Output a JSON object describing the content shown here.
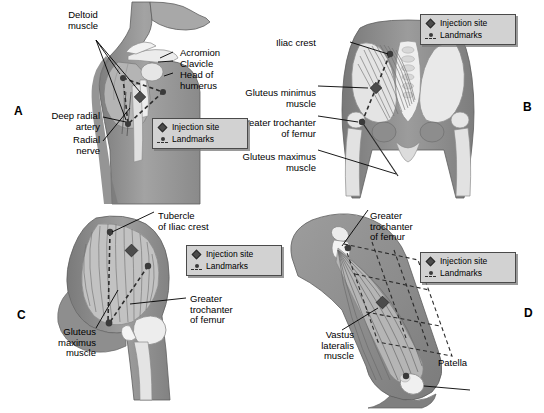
{
  "figure": {
    "background_color": "#ffffff",
    "body_color": "#909090",
    "bone_color": "#e8e8e8",
    "muscle_color": "#bdbdbd",
    "marker_color": "#4c4c4c"
  },
  "legend": {
    "injection_site_label": "Injection site",
    "landmarks_label": "Landmarks",
    "injection_site_icon": "diamond-marker-icon",
    "landmarks_icon": "dot-and-dashed-line-icon",
    "background_color": "#d2d2d2",
    "border_color": "#4a4a4a"
  },
  "panels": [
    {
      "id": "a",
      "letter": "A",
      "site_name": "Deltoid",
      "labels": [
        {
          "key": "deltoid",
          "text": "Deltoid\nmuscle",
          "align": "center"
        },
        {
          "key": "acromion",
          "text": "Acromion",
          "align": "left"
        },
        {
          "key": "clavicle",
          "text": "Clavicle",
          "align": "left"
        },
        {
          "key": "head-of-humerus",
          "text": "Head of\nhumerus",
          "align": "left"
        },
        {
          "key": "deep-radial-artery",
          "text": "Deep radial\nartery",
          "align": "right"
        },
        {
          "key": "radial-nerve",
          "text": "Radial\nnerve",
          "align": "right"
        }
      ]
    },
    {
      "id": "b",
      "letter": "B",
      "site_name": "Dorsogluteal",
      "labels": [
        {
          "key": "iliac-crest",
          "text": "Iliac crest",
          "align": "right"
        },
        {
          "key": "gluteus-minimus",
          "text": "Gluteus minimus\nmuscle",
          "align": "right"
        },
        {
          "key": "greater-trochanter",
          "text": "Greater trochanter\nof femur",
          "align": "right"
        },
        {
          "key": "gluteus-maximus",
          "text": "Gluteus maximus\nmuscle",
          "align": "right"
        }
      ]
    },
    {
      "id": "c",
      "letter": "C",
      "site_name": "Ventrogluteal",
      "labels": [
        {
          "key": "tubercle-of-iliac-crest",
          "text": "Tubercle\nof Iliac crest",
          "align": "left"
        },
        {
          "key": "greater-trochanter",
          "text": "Greater\ntrochanter\nof femur",
          "align": "left"
        },
        {
          "key": "gluteus-maximus",
          "text": "Gluteus\nmaximus\nmuscle",
          "align": "right"
        }
      ]
    },
    {
      "id": "d",
      "letter": "D",
      "site_name": "Vastus lateralis",
      "labels": [
        {
          "key": "greater-trochanter",
          "text": "Greater\ntrochanter\nof femur",
          "align": "left"
        },
        {
          "key": "vastus-lateralis",
          "text": "Vastus\nlateralis\nmuscle",
          "align": "right"
        },
        {
          "key": "patella",
          "text": "Patella",
          "align": "left"
        }
      ]
    }
  ]
}
